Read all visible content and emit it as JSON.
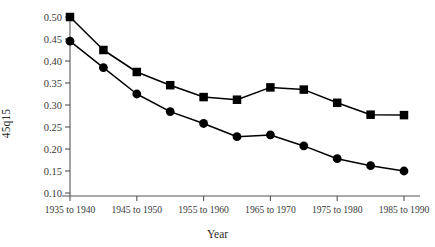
{
  "chart_data": {
    "type": "line",
    "title": "",
    "xlabel": "Year",
    "ylabel": "45q15",
    "categories": [
      "1935 to 1940",
      "1940 to 1945",
      "1945 to 1950",
      "1950 to 1955",
      "1955 to 1960",
      "1960 to 1965",
      "1965 to 1970",
      "1970 to 1975",
      "1975 to 1980",
      "1980 to 1985",
      "1985 to 1990"
    ],
    "tick_labels_x": [
      "1935 to 1940",
      "1945 to 1950",
      "1955 to 1960",
      "1965 to 1970",
      "1975 to 1980",
      "1985 to 1990"
    ],
    "tick_labels_y": [
      "0.10",
      "0.15",
      "0.20",
      "0.25",
      "0.30",
      "0.35",
      "0.40",
      "0.45",
      "0.50"
    ],
    "ylim": [
      0.1,
      0.5
    ],
    "ytick_step": 0.05,
    "grid": false,
    "legend": "none",
    "series": [
      {
        "name": "Male",
        "marker": "square",
        "color": "#000000",
        "values": [
          0.5,
          0.425,
          0.375,
          0.345,
          0.318,
          0.312,
          0.34,
          0.335,
          0.305,
          0.278,
          0.277
        ]
      },
      {
        "name": "Female",
        "marker": "circle",
        "color": "#000000",
        "values": [
          0.445,
          0.385,
          0.325,
          0.285,
          0.258,
          0.228,
          0.232,
          0.207,
          0.178,
          0.162,
          0.15
        ]
      }
    ]
  },
  "axes": {
    "y_title": "45q15",
    "x_title": "Year"
  },
  "colors": {
    "line": "#000000",
    "marker": "#000000",
    "axis": "#555555",
    "text": "#2b2b2b"
  }
}
